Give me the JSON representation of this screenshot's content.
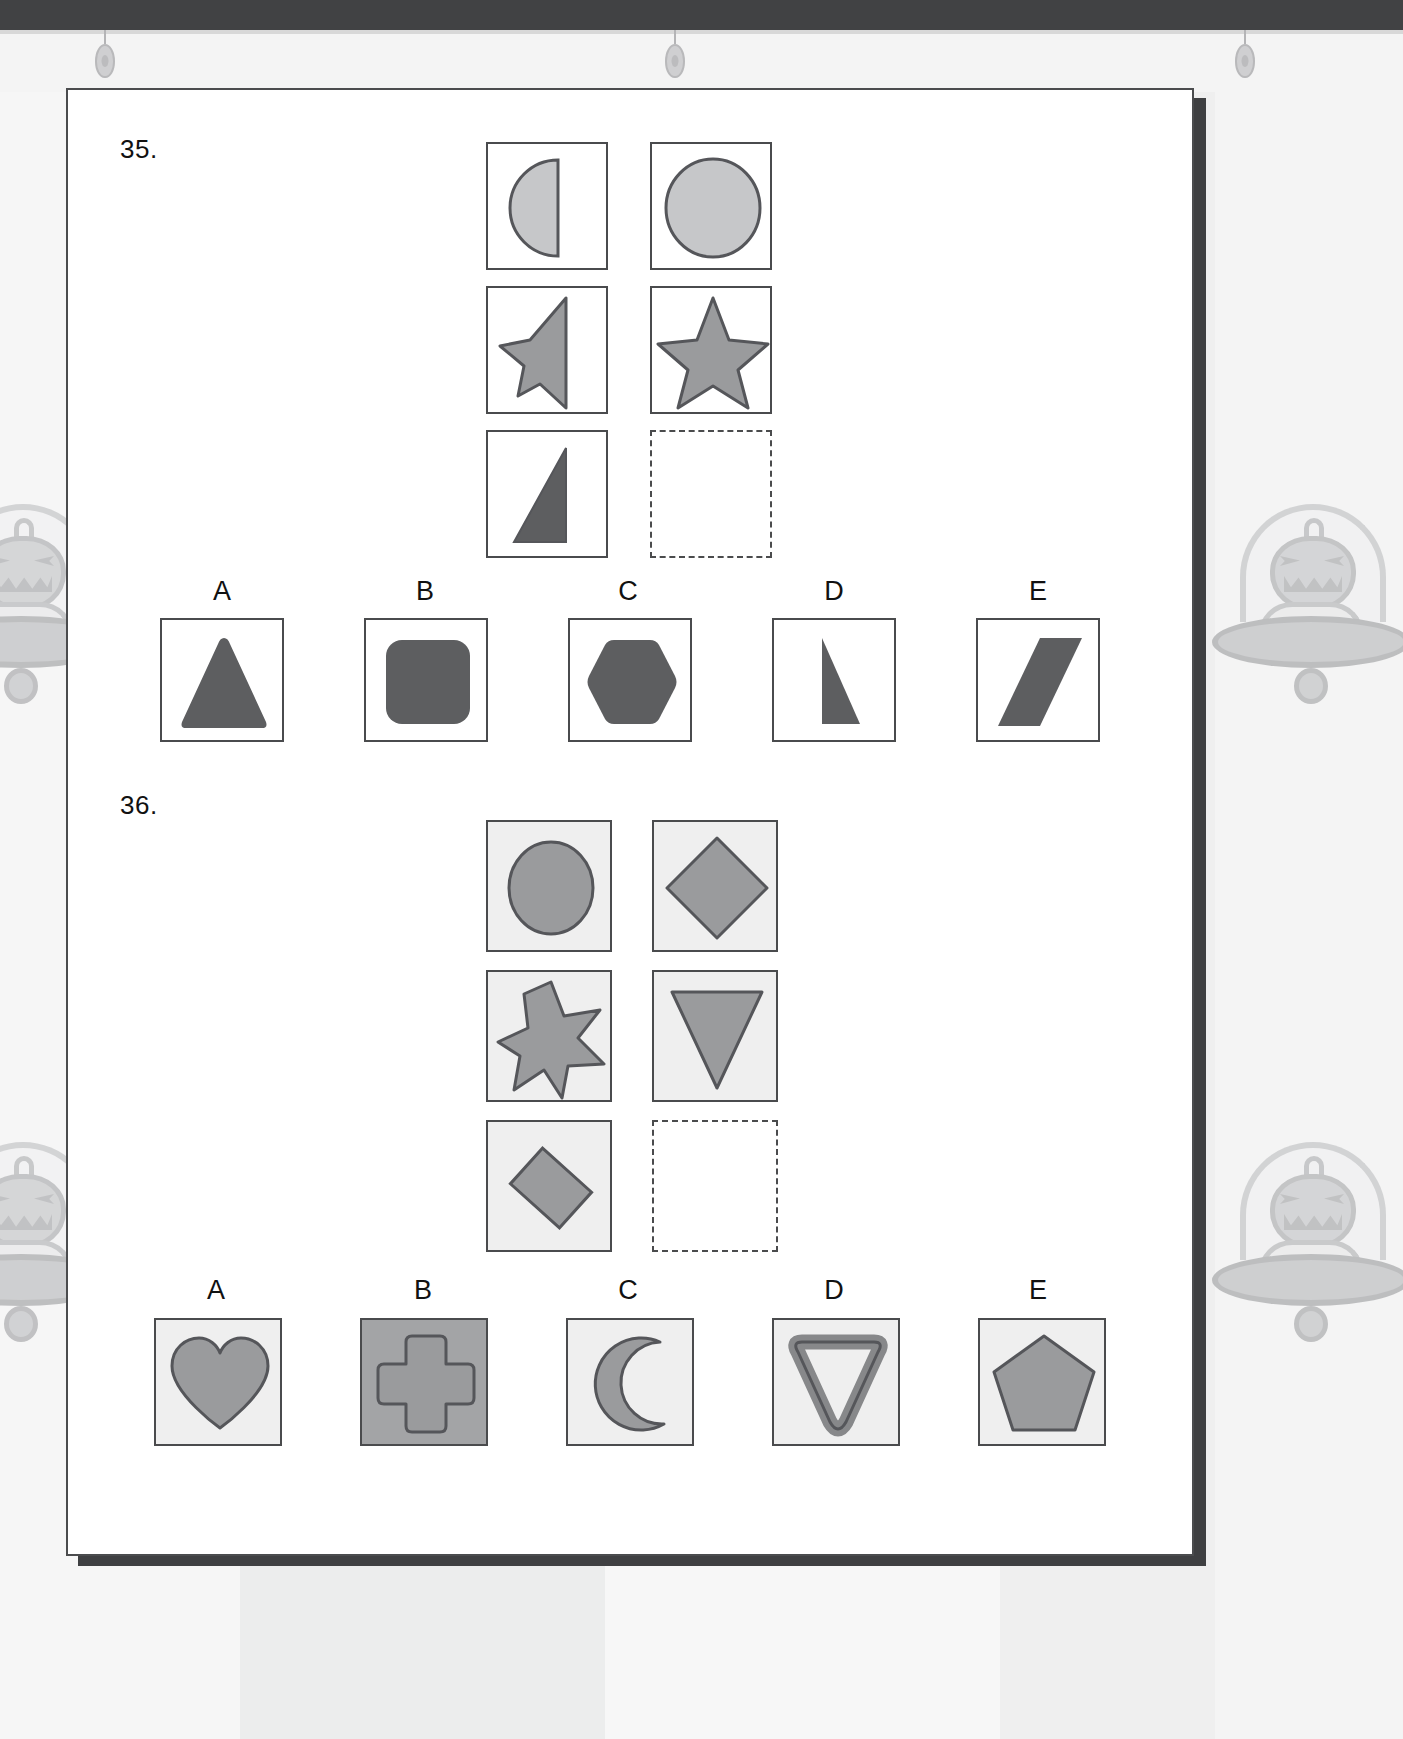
{
  "page": {
    "background_theme": "halloween-pumpkin-ufo",
    "sheet_background": "#ffffff",
    "colors": {
      "ink": "#4a4b4d",
      "light_fill": "#c6c7c9",
      "mid_fill": "#9a9b9d",
      "dark_fill": "#5d5e60",
      "cell_tint": "#efefef",
      "dark_tint": "#a3a4a6",
      "top_bar": "#414244",
      "page_shadow": "#3f4042"
    }
  },
  "questions": [
    {
      "number": "35.",
      "matrix": {
        "rows": 3,
        "cols": 2,
        "cells": [
          {
            "row": 1,
            "col": 1,
            "shape": "half-circle",
            "fill": "light",
            "tinted": false
          },
          {
            "row": 1,
            "col": 2,
            "shape": "circle",
            "fill": "light",
            "tinted": false
          },
          {
            "row": 2,
            "col": 1,
            "shape": "half-star",
            "fill": "mid",
            "tinted": false
          },
          {
            "row": 2,
            "col": 2,
            "shape": "five-point-star",
            "fill": "mid",
            "tinted": false
          },
          {
            "row": 3,
            "col": 1,
            "shape": "half-triangle",
            "fill": "dark",
            "tinted": false
          },
          {
            "row": 3,
            "col": 2,
            "shape": "empty",
            "fill": "none",
            "tinted": false
          }
        ]
      },
      "options": [
        {
          "label": "A",
          "shape": "triangle",
          "fill": "dark",
          "box_style": "plain"
        },
        {
          "label": "B",
          "shape": "rounded-square",
          "fill": "dark",
          "box_style": "plain"
        },
        {
          "label": "C",
          "shape": "hexagon",
          "fill": "dark",
          "box_style": "plain"
        },
        {
          "label": "D",
          "shape": "right-triangle",
          "fill": "dark",
          "box_style": "plain"
        },
        {
          "label": "E",
          "shape": "parallelogram",
          "fill": "dark",
          "box_style": "plain"
        }
      ]
    },
    {
      "number": "36.",
      "matrix": {
        "rows": 3,
        "cols": 2,
        "cells": [
          {
            "row": 1,
            "col": 1,
            "shape": "circle",
            "fill": "mid",
            "tinted": true
          },
          {
            "row": 1,
            "col": 2,
            "shape": "diamond",
            "fill": "mid",
            "tinted": true
          },
          {
            "row": 2,
            "col": 1,
            "shape": "seven-point-star",
            "fill": "mid",
            "tinted": true
          },
          {
            "row": 2,
            "col": 2,
            "shape": "down-triangle",
            "fill": "mid",
            "tinted": true
          },
          {
            "row": 3,
            "col": 1,
            "shape": "tilted-rectangle",
            "fill": "mid",
            "tinted": true
          },
          {
            "row": 3,
            "col": 2,
            "shape": "empty",
            "fill": "none",
            "tinted": false
          }
        ]
      },
      "options": [
        {
          "label": "A",
          "shape": "heart",
          "fill": "mid",
          "box_style": "tinted"
        },
        {
          "label": "B",
          "shape": "cross",
          "fill": "mid",
          "box_style": "dark"
        },
        {
          "label": "C",
          "shape": "crescent-moon",
          "fill": "mid",
          "box_style": "tinted"
        },
        {
          "label": "D",
          "shape": "triangle-outline",
          "fill": "mid",
          "box_style": "tinted"
        },
        {
          "label": "E",
          "shape": "pentagon",
          "fill": "mid",
          "box_style": "tinted"
        }
      ]
    }
  ]
}
